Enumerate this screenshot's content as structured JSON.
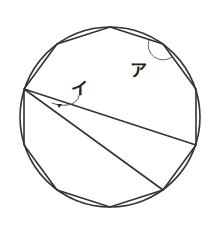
{
  "figure": {
    "type": "geometry",
    "circle": {
      "cx": 110,
      "cy": 117,
      "r": 90
    },
    "polygon_sides": 10,
    "labels": {
      "angle_a": "ア",
      "angle_i": "イ"
    },
    "stroke_color": "#333333"
  }
}
